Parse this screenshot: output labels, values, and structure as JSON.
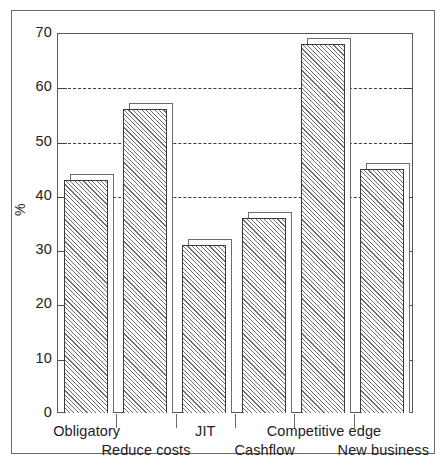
{
  "chart_data": {
    "type": "bar",
    "title": "",
    "subtitle": "",
    "xlabel": "",
    "ylabel": "%",
    "categories": [
      "Obligatory",
      "Reduce costs",
      "JIT",
      "Cashflow",
      "Competitive edge",
      "New business"
    ],
    "values": [
      43,
      56,
      31,
      36,
      68,
      45
    ],
    "series": [
      {
        "name": "",
        "values": [
          43,
          56,
          31,
          36,
          68,
          45
        ]
      }
    ],
    "ylim": [
      0,
      70
    ],
    "ytick_labels": [
      "0",
      "10",
      "20",
      "30",
      "40",
      "50",
      "60",
      "70"
    ],
    "ytick_values": [
      0,
      10,
      20,
      30,
      40,
      50,
      60,
      70
    ],
    "gridline_values": [
      40,
      50,
      60
    ],
    "grid": "horizontal-dashed",
    "legend": "none",
    "bar_style": "hatched-3d",
    "annotations": []
  },
  "axes": {
    "y_title": "%",
    "y_ticks": [
      {
        "label": "70",
        "value": 70
      },
      {
        "label": "60",
        "value": 60
      },
      {
        "label": "50",
        "value": 50
      },
      {
        "label": "40",
        "value": 40
      },
      {
        "label": "30",
        "value": 30
      },
      {
        "label": "20",
        "value": 20
      },
      {
        "label": "10",
        "value": 10
      },
      {
        "label": "0",
        "value": 0
      }
    ],
    "x_labels_top": [
      "Obligatory",
      "JIT",
      "Competitive edge"
    ],
    "x_labels_bottom": [
      "Reduce costs",
      "Cashflow",
      "New business"
    ]
  },
  "colors": {
    "plot_border": "#58585a",
    "frame_border": "#6a6a6a",
    "bar_outline": "#3c3c3e",
    "bar_shadow_outline": "#6d6d6f",
    "hatch": "#6e6e70",
    "gridline": "#3a3a3a",
    "text": "#222222",
    "background": "#ffffff"
  }
}
